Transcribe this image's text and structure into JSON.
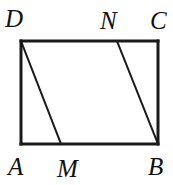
{
  "figure": {
    "kind": "geometry-diagram",
    "background_color": "#ffffff",
    "stroke_color": "#1a1a1a",
    "outline_stroke_width": 3,
    "diagonal_stroke_width": 2,
    "canvas": {
      "width": 173,
      "height": 185
    },
    "rectangle": {
      "top_left": {
        "x": 21,
        "y": 41
      },
      "top_right": {
        "x": 158,
        "y": 41
      },
      "bottom_right": {
        "x": 158,
        "y": 144
      },
      "bottom_left": {
        "x": 21,
        "y": 144
      }
    },
    "points": {
      "A": {
        "x": 21,
        "y": 144
      },
      "B": {
        "x": 158,
        "y": 144
      },
      "C": {
        "x": 158,
        "y": 41
      },
      "D": {
        "x": 21,
        "y": 41
      },
      "M": {
        "x": 61,
        "y": 144
      },
      "N": {
        "x": 117,
        "y": 41
      }
    },
    "segments": [
      {
        "name": "side-DC-top",
        "from": "D",
        "to": "C"
      },
      {
        "name": "side-CB-right",
        "from": "C",
        "to": "B"
      },
      {
        "name": "side-BA-bottom",
        "from": "B",
        "to": "A"
      },
      {
        "name": "side-AD-left",
        "from": "A",
        "to": "D"
      },
      {
        "name": "segment-DM",
        "from": "D",
        "to": "M"
      },
      {
        "name": "segment-NB",
        "from": "N",
        "to": "B"
      }
    ],
    "labels": [
      {
        "id": "D",
        "text": "D",
        "x": 5,
        "y": 6,
        "anchor": "top-left"
      },
      {
        "id": "N",
        "text": "N",
        "x": 100,
        "y": 8,
        "anchor": "top-left"
      },
      {
        "id": "C",
        "text": "C",
        "x": 150,
        "y": 8,
        "anchor": "top-left"
      },
      {
        "id": "A",
        "text": "A",
        "x": 8,
        "y": 154,
        "anchor": "bottom-left"
      },
      {
        "id": "M",
        "text": "M",
        "x": 57,
        "y": 156,
        "anchor": "bottom-left"
      },
      {
        "id": "B",
        "text": "B",
        "x": 148,
        "y": 154,
        "anchor": "bottom-left"
      }
    ]
  }
}
